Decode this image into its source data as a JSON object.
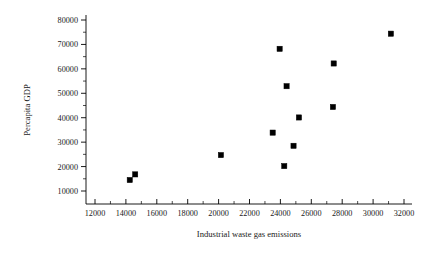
{
  "chart_data": {
    "type": "scatter",
    "title": "",
    "xlabel": "Industrial waste gas emissions",
    "ylabel": "Percapita GDP",
    "xlim": [
      12000,
      32000
    ],
    "ylim": [
      10000,
      80000
    ],
    "xticks": [
      12000,
      14000,
      16000,
      18000,
      20000,
      22000,
      24000,
      26000,
      28000,
      30000,
      32000
    ],
    "yticks": [
      10000,
      20000,
      30000,
      40000,
      50000,
      60000,
      70000,
      80000
    ],
    "xtick_labels": [
      "12000",
      "14000",
      "16000",
      "18000",
      "20000",
      "22000",
      "24000",
      "26000",
      "28000",
      "30000",
      "32000"
    ],
    "ytick_labels": [
      "10000",
      "20000",
      "30000",
      "40000",
      "50000",
      "60000",
      "70000",
      "80000"
    ],
    "grid": false,
    "legend": null,
    "minor_ticks": true,
    "marker_style": "filled-square",
    "marker_color": "#000000",
    "series": [
      {
        "name": "observations",
        "points": [
          {
            "x": 14250,
            "y": 14500
          },
          {
            "x": 14600,
            "y": 16800
          },
          {
            "x": 20150,
            "y": 24700
          },
          {
            "x": 23500,
            "y": 33900
          },
          {
            "x": 23950,
            "y": 68200
          },
          {
            "x": 24250,
            "y": 20200
          },
          {
            "x": 24400,
            "y": 52900
          },
          {
            "x": 24850,
            "y": 28500
          },
          {
            "x": 25200,
            "y": 40100
          },
          {
            "x": 27400,
            "y": 44400
          },
          {
            "x": 27450,
            "y": 62200
          },
          {
            "x": 31150,
            "y": 74400
          }
        ]
      }
    ]
  },
  "axes": {
    "x_axis_name": "x-axis",
    "y_axis_name": "y-axis"
  }
}
